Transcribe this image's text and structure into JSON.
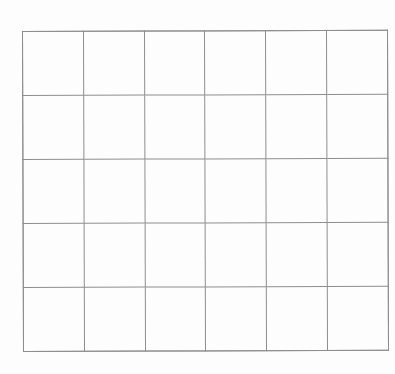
{
  "page": {
    "background_color": "#fdfdfd",
    "width": 395,
    "height": 374
  },
  "grid": {
    "name": "blank-grid",
    "columns": 6,
    "rows": 5,
    "total_cells": 30,
    "line_color": "#8e8e8e",
    "line_width_px": 1,
    "cell_fill": "#ffffff",
    "bounds": {
      "left": 22,
      "top": 31,
      "right": 388,
      "bottom": 352
    },
    "column_line_x": [
      22,
      81,
      142,
      203,
      264,
      327,
      388
    ],
    "row_line_y": [
      31,
      98,
      161,
      225,
      288,
      352
    ],
    "cells": [
      [
        "",
        "",
        "",
        "",
        "",
        ""
      ],
      [
        "",
        "",
        "",
        "",
        "",
        ""
      ],
      [
        "",
        "",
        "",
        "",
        "",
        ""
      ],
      [
        "",
        "",
        "",
        "",
        "",
        ""
      ],
      [
        "",
        "",
        "",
        "",
        "",
        ""
      ]
    ]
  }
}
